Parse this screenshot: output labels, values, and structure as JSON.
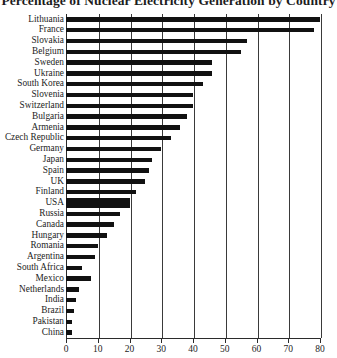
{
  "chart_data": {
    "type": "bar",
    "orientation": "horizontal",
    "title": "Percentage of Nuclear Electricity Generation by Country",
    "xlabel": "",
    "ylabel": "",
    "xlim": [
      0,
      80
    ],
    "xticks": [
      0,
      10,
      20,
      30,
      40,
      50,
      60,
      70,
      80
    ],
    "grid": true,
    "grid_axis": "x",
    "legend": false,
    "bar_color": "#111111",
    "categories": [
      "Lithuania",
      "France",
      "Slovakia",
      "Belgium",
      "Sweden",
      "Ukraine",
      "South Korea",
      "Slovenia",
      "Switzerland",
      "Bulgaria",
      "Armenia",
      "Czech Republic",
      "Germany",
      "Japan",
      "Spain",
      "UK",
      "Finland",
      "USA",
      "Russia",
      "Canada",
      "Hungary",
      "Romania",
      "Argentina",
      "South Africa",
      "Mexico",
      "Netherlands",
      "India",
      "Brazil",
      "Pakistan",
      "China"
    ],
    "values": [
      80,
      78,
      57,
      55,
      46,
      46,
      43,
      40,
      40,
      38,
      36,
      33,
      30,
      27,
      26,
      25,
      22,
      20,
      17,
      15,
      13,
      10,
      9,
      5,
      8,
      4,
      3,
      2.5,
      2,
      2
    ]
  }
}
